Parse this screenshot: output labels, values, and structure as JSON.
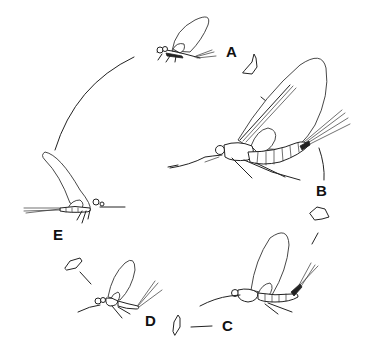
{
  "diagram": {
    "type": "life-cycle",
    "stages": [
      {
        "id": "A",
        "label": "A",
        "description": "adult mayfly resting, wings folded (top)"
      },
      {
        "id": "B",
        "label": "B",
        "description": "large adult mayfly on twig, wings raised (right)"
      },
      {
        "id": "C",
        "label": "C",
        "description": "adult mayfly on twig (bottom right)"
      },
      {
        "id": "D",
        "label": "D",
        "description": "small adult mayfly on twig (bottom left)"
      },
      {
        "id": "E",
        "label": "E",
        "description": "adult mayfly with tails extended left (left)"
      }
    ],
    "arrows": [
      {
        "from": "A",
        "to": "B",
        "icon": "cycle-arrow-icon"
      },
      {
        "from": "B",
        "to": "C",
        "icon": "cycle-arrow-icon"
      },
      {
        "from": "C",
        "to": "D",
        "icon": "cycle-arrow-icon"
      },
      {
        "from": "D",
        "to": "E",
        "icon": "cycle-arrow-icon"
      },
      {
        "from": "E",
        "to": "A",
        "icon": "cycle-arc"
      }
    ],
    "colors": {
      "background": "#ffffff",
      "ink": "#222222"
    }
  }
}
